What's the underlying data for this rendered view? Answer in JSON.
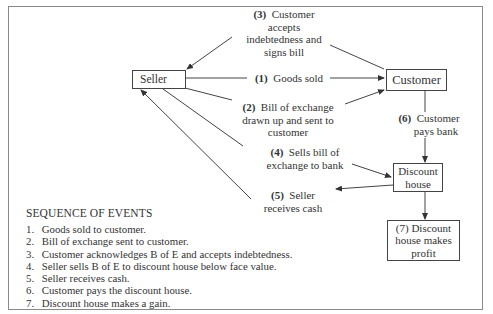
{
  "diagram": {
    "nodes": {
      "seller": "Seller",
      "customer": "Customer",
      "discount_house": [
        "Discount",
        "house"
      ],
      "profit": [
        "(7) Discount",
        "house makes",
        "profit"
      ]
    },
    "edges": {
      "e3": {
        "num": "(3)",
        "lines": [
          "Customer",
          "accepts",
          "indebtedness and",
          "signs bill"
        ]
      },
      "e1": {
        "num": "(1)",
        "text": "Goods sold"
      },
      "e2": {
        "num": "(2)",
        "lines": [
          "Bill of exchange",
          "drawn up and sent to",
          "customer"
        ]
      },
      "e4": {
        "num": "(4)",
        "lines": [
          "Sells bill of",
          "exchange to bank"
        ]
      },
      "e5": {
        "num": "(5)",
        "lines": [
          "Seller",
          "receives cash"
        ]
      },
      "e6": {
        "num": "(6)",
        "lines": [
          "Customer",
          "pays bank"
        ]
      }
    }
  },
  "sequence": {
    "heading": "SEQUENCE OF EVENTS",
    "items": [
      {
        "n": "1.",
        "text": "Goods sold to customer."
      },
      {
        "n": "2.",
        "text": "Bill of exchange sent to customer."
      },
      {
        "n": "3.",
        "text": "Customer acknowledges B of E and accepts indebtedness."
      },
      {
        "n": "4.",
        "text": "Seller sells B of E to discount house below face value."
      },
      {
        "n": "5.",
        "text": "Seller receives cash."
      },
      {
        "n": "6.",
        "text": "Customer pays the discount house."
      },
      {
        "n": "7.",
        "text": "Discount house makes a gain."
      }
    ]
  }
}
